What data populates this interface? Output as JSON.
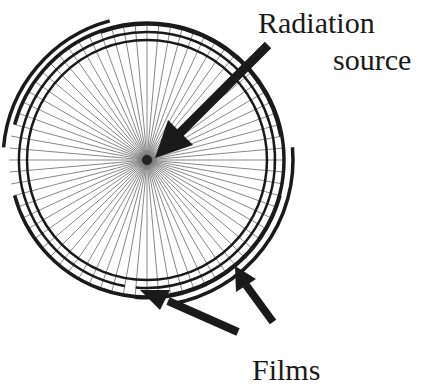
{
  "labels": {
    "source_line1": "Radiation",
    "source_line2": "source",
    "films": "Films"
  },
  "diagram": {
    "ray_count": 72,
    "ink_color": "#1a1a1a",
    "ray_color": "#6a6a6a"
  }
}
